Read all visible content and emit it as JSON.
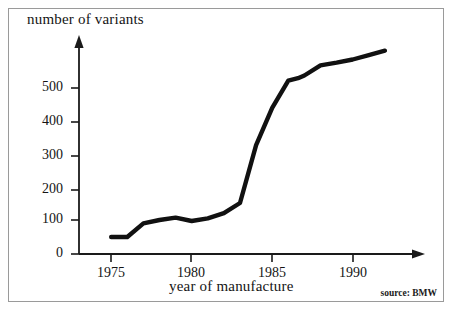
{
  "figure": {
    "source_note": "source: BMW",
    "line_color": "#111111",
    "axis_color": "#1a1a1a",
    "frame_color": "#9a9a9a",
    "background": "#ffffff"
  },
  "chart_data": {
    "type": "line",
    "title": "",
    "xlabel": "year of manufacture",
    "ylabel": "number of variants",
    "xlim": [
      1974,
      1992.5
    ],
    "ylim": [
      0,
      620
    ],
    "grid": false,
    "legend": null,
    "annotations": [
      "source: BMW"
    ],
    "x_ticks": [
      1975,
      1980,
      1985,
      1990
    ],
    "x_tick_labels": [
      "1975",
      "1980",
      "1985",
      "1990"
    ],
    "y_ticks": [
      0,
      100,
      200,
      300,
      400,
      500
    ],
    "y_tick_labels": [
      "0",
      "100",
      "200",
      "300",
      "400",
      "500"
    ],
    "x": [
      1975,
      1976,
      1977,
      1978,
      1979,
      1980,
      1981,
      1982,
      1983,
      1984,
      1985,
      1986,
      1986.6,
      1987,
      1988,
      1989,
      1990,
      1991,
      1992
    ],
    "values": [
      50,
      50,
      90,
      100,
      107,
      97,
      105,
      120,
      150,
      320,
      430,
      510,
      517,
      525,
      555,
      563,
      572,
      585,
      598
    ],
    "series": [
      {
        "name": "number of variants",
        "values": [
          50,
          50,
          90,
          100,
          107,
          97,
          105,
          120,
          150,
          320,
          430,
          510,
          517,
          525,
          555,
          563,
          572,
          585,
          598
        ]
      }
    ]
  },
  "axes": {
    "y_title": "number of variants",
    "x_title": "year of manufacture",
    "y_tick_labels": [
      "500",
      "400",
      "300",
      "200",
      "100",
      "0"
    ],
    "x_tick_labels": [
      "1975",
      "1980",
      "1985",
      "1990"
    ]
  }
}
